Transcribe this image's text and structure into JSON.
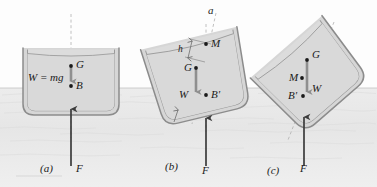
{
  "figure": {
    "colors": {
      "water": "#e9e9e9",
      "water_line": "#c8c8c8",
      "hull_stroke": "#8c8c8c",
      "hull_fill": "#d6d6d6",
      "interior_fill": "#dcdcdc",
      "weight_arrow": "#8f8f8f",
      "buoyancy_arrow": "#3b3b3b",
      "axis_dash": "#b0b0b0",
      "text": "#1a1a1a"
    }
  },
  "panels": [
    {
      "id": "a",
      "caption": "(a)",
      "state": "upright-stable",
      "labels": {
        "gravity_center": "G",
        "buoyancy_center": "B",
        "weight": "W = mg",
        "buoyant_force": "F"
      }
    },
    {
      "id": "b",
      "caption": "(b)",
      "state": "tilted-stable",
      "labels": {
        "axis": "a",
        "metacenter": "M",
        "gravity_center": "G",
        "buoyancy_center": "B'",
        "metacentric_height": "h",
        "weight": "W",
        "buoyant_force": "F"
      }
    },
    {
      "id": "c",
      "caption": "(c)",
      "state": "tilted-unstable",
      "labels": {
        "metacenter": "M",
        "gravity_center": "G",
        "buoyancy_center": "B'",
        "weight": "W",
        "buoyant_force": "F"
      }
    }
  ]
}
